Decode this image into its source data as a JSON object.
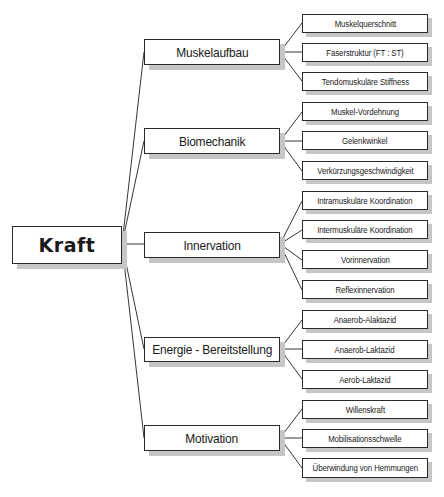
{
  "diagram": {
    "root": {
      "label": "Kraft"
    },
    "branches": [
      {
        "label": "Muskelaufbau",
        "children": [
          "Muskelquerschnitt",
          "Faserstruktur (FT : ST)",
          "Tendomuskuläre Stiffness"
        ]
      },
      {
        "label": "Biomechanik",
        "children": [
          "Muskel-Vordehnung",
          "Gelenkwinkel",
          "Verkürzungsgeschwindigkeit"
        ]
      },
      {
        "label": "Innervation",
        "children": [
          "Intramuskuläre Koordination",
          "Intermuskuläre Koordination",
          "Vorinnervation",
          "Reflexinnervation"
        ]
      },
      {
        "label": "Energie - Bereitstellung",
        "children": [
          "Anaerob-Alaktazid",
          "Anaerob-Laktazid",
          "Aerob-Laktazid"
        ]
      },
      {
        "label": "Motivation",
        "children": [
          "Willenskraft",
          "Mobilisationsschwelle",
          "Überwindung von Hemmungen"
        ]
      }
    ]
  },
  "colors": {
    "line": "#1e1e1e",
    "border": "#2a2a2a",
    "shadow": "#c6c6c6",
    "background": "#ffffff"
  }
}
